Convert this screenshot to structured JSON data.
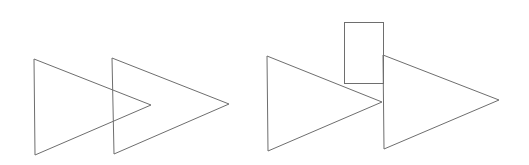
{
  "canvas": {
    "width": 529,
    "height": 165,
    "background": "#ffffff"
  },
  "stroke_color": "#6e6e6e",
  "groups": [
    {
      "name": "left-pair",
      "description": "Two overlapping right-pointing triangles",
      "shapes": [
        {
          "type": "triangle",
          "direction": "right",
          "points": "34,59 35,155 151,105"
        },
        {
          "type": "triangle",
          "direction": "right",
          "points": "112,58 114,154 229,104"
        }
      ]
    },
    {
      "name": "right-group",
      "description": "Two touching right-pointing triangles with a rectangle above the junction",
      "shapes": [
        {
          "type": "triangle",
          "direction": "right",
          "points": "267,56 268,151 382,102"
        },
        {
          "type": "rectangle",
          "x": 344,
          "y": 22,
          "width": 39,
          "height": 61
        },
        {
          "type": "triangle",
          "direction": "right",
          "points": "383,55 384,149 499,100"
        }
      ]
    }
  ]
}
